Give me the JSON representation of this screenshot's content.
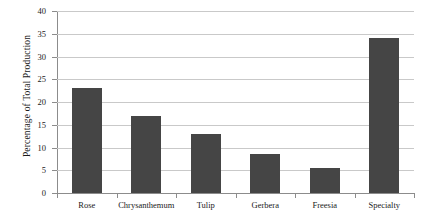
{
  "chart_data": {
    "type": "bar",
    "title": "",
    "xlabel": "",
    "ylabel": "Percentage of Total Production",
    "categories": [
      "Rose",
      "Chrysanthemum",
      "Tulip",
      "Gerbera",
      "Freesia",
      "Specialty"
    ],
    "values": [
      23,
      17,
      13,
      8.5,
      5.5,
      34
    ],
    "ylim": [
      0,
      40
    ],
    "yticks": [
      0,
      5,
      10,
      15,
      20,
      25,
      30,
      35,
      40
    ],
    "ytick_labels": [
      "0",
      "5",
      "10",
      "15",
      "20",
      "25",
      "30",
      "35",
      "40"
    ],
    "grid": "horizontal",
    "legend": "none",
    "series": [
      {
        "name": "Percentage of Total Production",
        "color": "#454545",
        "values": [
          23,
          17,
          13,
          8.5,
          5.5,
          34
        ]
      }
    ],
    "bar_color": "#454545",
    "axis_color": "#8c8c8c",
    "gridline_color": "#c9c9c9",
    "background_color": "#ffffff"
  }
}
